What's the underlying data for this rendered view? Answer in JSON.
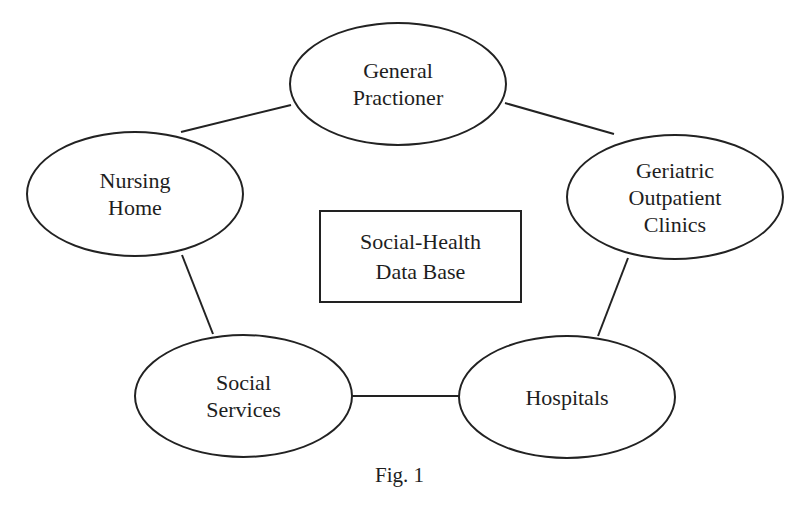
{
  "diagram": {
    "nodes": [
      {
        "id": "general-practioner",
        "lines": [
          "General",
          "Practioner"
        ]
      },
      {
        "id": "nursing-home",
        "lines": [
          "Nursing",
          "Home"
        ]
      },
      {
        "id": "geriatric-outpatient-clinics",
        "lines": [
          "Geriatric",
          "Outpatient",
          "Clinics"
        ]
      },
      {
        "id": "social-services",
        "lines": [
          "Social",
          "Services"
        ]
      },
      {
        "id": "hospitals",
        "lines": [
          "Hospitals"
        ]
      }
    ],
    "center": {
      "lines": [
        "Social-Health",
        "Data Base"
      ]
    },
    "edges": [
      [
        "general-practioner",
        "nursing-home"
      ],
      [
        "general-practioner",
        "geriatric-outpatient-clinics"
      ],
      [
        "nursing-home",
        "social-services"
      ],
      [
        "geriatric-outpatient-clinics",
        "hospitals"
      ],
      [
        "social-services",
        "hospitals"
      ]
    ],
    "caption": "Fig. 1"
  }
}
